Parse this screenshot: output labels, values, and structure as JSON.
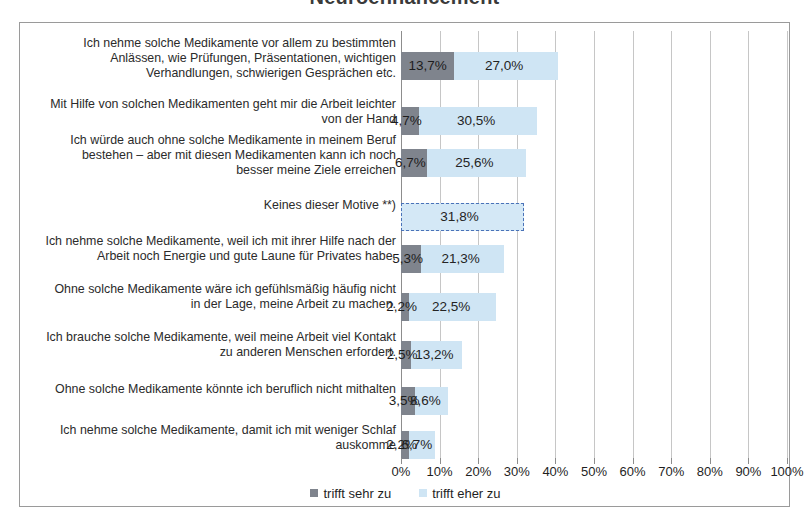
{
  "title": "Neuroenhancement",
  "legend": {
    "position": "bottom-center",
    "items": [
      {
        "label": "trifft sehr zu",
        "color": "#7f848d",
        "key": "trifft_sehr_zu"
      },
      {
        "label": "trifft eher zu",
        "color": "#cfe5f4",
        "key": "trifft_eher_zu"
      }
    ]
  },
  "axis": {
    "ticks": [
      "0%",
      "10%",
      "20%",
      "30%",
      "40%",
      "50%",
      "60%",
      "70%",
      "80%",
      "90%",
      "100%"
    ],
    "min": 0,
    "max": 100,
    "step": 10,
    "grid": true
  },
  "chart_data": {
    "type": "bar",
    "orientation": "horizontal",
    "stacked": true,
    "title": "Neuroenhancement",
    "xlabel": "",
    "ylabel": "",
    "xlim": [
      0,
      100
    ],
    "grid": true,
    "legend_position": "bottom-center",
    "categories": [
      "Ich nehme solche Medikamente vor allem zu bestimmten Anlässen, wie Prüfungen,  Präsentationen, wichtigen Verhandlungen,  schwierigen Gesprächen etc.",
      "Mit Hilfe von solchen Medikamenten geht mir die Arbeit leichter von der Hand",
      "Ich würde auch ohne solche Medikamente in meinem Beruf bestehen – aber mit diesen Medikamenten kann ich noch besser meine Ziele erreichen",
      "Keines dieser Motive **)",
      "Ich nehme solche Medikamente, weil ich mit ihrer Hilfe nach der Arbeit noch Energie und gute Laune für Privates habe.",
      "Ohne solche Medikamente wäre ich gefühlsmäßig häufig nicht in der Lage, meine Arbeit zu machen.",
      "Ich brauche solche Medikamente, weil meine Arbeit viel Kontakt zu anderen Menschen erfordert.",
      "Ohne solche Medikamente könnte ich beruflich nicht mithalten",
      "Ich nehme solche Medikamente, damit ich mit weniger Schlaf auskomme"
    ],
    "series": [
      {
        "name": "trifft sehr zu",
        "color": "#7f848d",
        "values": [
          13.7,
          4.7,
          6.7,
          null,
          5.3,
          2.2,
          2.5,
          3.5,
          2.2
        ],
        "labels": [
          "13,7%",
          "4,7%",
          "6,7%",
          "",
          "5,3%",
          "2,2%",
          "2,5%",
          "3,5%",
          "2,2%"
        ]
      },
      {
        "name": "trifft eher zu",
        "color": "#cfe5f4",
        "values": [
          27.0,
          30.5,
          25.6,
          31.8,
          21.3,
          22.5,
          13.2,
          8.6,
          6.7
        ],
        "labels": [
          "27,0%",
          "30,5%",
          "25,6%",
          "31,8%",
          "21,3%",
          "22,5%",
          "13,2%",
          "8,6%",
          "6,7%"
        ]
      }
    ],
    "special_rows": [
      {
        "index": 3,
        "style": "dashed-outline",
        "outline_color": "#4a72b8",
        "note": "Keines dieser Motive **) – single light bar with dashed border"
      }
    ]
  },
  "rows": [
    {
      "label_lines": [
        "Ich nehme solche Medikamente vor allem zu bestimmten",
        "Anlässen, wie Prüfungen,  Präsentationen, wichtigen",
        "Verhandlungen,  schwierigen Gesprächen etc."
      ],
      "dark_value": 13.7,
      "dark_label": "13,7%",
      "light_value": 27.0,
      "light_label": "27,0%"
    },
    {
      "label_lines": [
        "Mit Hilfe von solchen Medikamenten geht mir die Arbeit leichter",
        "von der Hand"
      ],
      "dark_value": 4.7,
      "dark_label": "4,7%",
      "light_value": 30.5,
      "light_label": "30,5%"
    },
    {
      "label_lines": [
        "Ich würde auch ohne solche Medikamente in meinem Beruf",
        "bestehen – aber mit diesen Medikamenten kann ich noch",
        "besser meine Ziele erreichen"
      ],
      "dark_value": 6.7,
      "dark_label": "6,7%",
      "light_value": 25.6,
      "light_label": "25,6%"
    },
    {
      "label_lines": [
        "Keines dieser Motive **)"
      ],
      "dark_value": 0,
      "dark_label": "",
      "light_value": 31.8,
      "light_label": "31,8%"
    },
    {
      "label_lines": [
        "Ich nehme solche Medikamente, weil ich mit ihrer Hilfe nach der",
        "Arbeit noch Energie und gute Laune für Privates habe."
      ],
      "dark_value": 5.3,
      "dark_label": "5,3%",
      "light_value": 21.3,
      "light_label": "21,3%"
    },
    {
      "label_lines": [
        "Ohne solche Medikamente wäre ich gefühlsmäßig häufig nicht",
        "in der Lage, meine Arbeit zu machen."
      ],
      "dark_value": 2.2,
      "dark_label": "2,2%",
      "light_value": 22.5,
      "light_label": "22,5%"
    },
    {
      "label_lines": [
        "Ich brauche solche Medikamente, weil meine Arbeit viel Kontakt",
        "zu anderen Menschen erfordert."
      ],
      "dark_value": 2.5,
      "dark_label": "2,5%",
      "light_value": 13.2,
      "light_label": "13,2%"
    },
    {
      "label_lines": [
        "Ohne solche Medikamente könnte ich beruflich nicht mithalten"
      ],
      "dark_value": 3.5,
      "dark_label": "3,5%",
      "light_value": 8.6,
      "light_label": "8,6%"
    },
    {
      "label_lines": [
        "Ich nehme solche Medikamente, damit ich mit weniger Schlaf",
        "auskomme"
      ],
      "dark_value": 2.2,
      "dark_label": "2,2%",
      "light_value": 6.7,
      "light_label": "6,7%"
    }
  ]
}
